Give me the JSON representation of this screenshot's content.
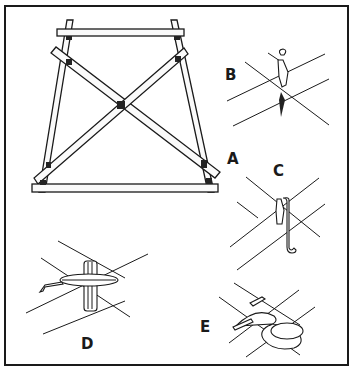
{
  "figure": {
    "labels": {
      "A": "A",
      "B": "B",
      "C": "C",
      "D": "D",
      "E": "E"
    },
    "colors": {
      "ink": "#1a1a1a",
      "paper": "#ffffff"
    }
  }
}
